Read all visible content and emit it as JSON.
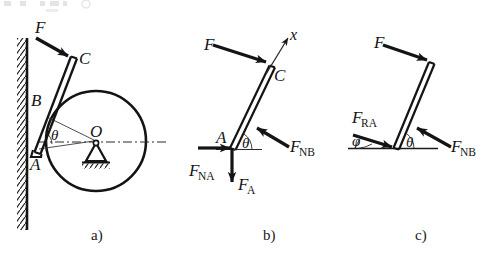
{
  "figure": {
    "title_artifact": "partially cropped text row at top edge",
    "captions": [
      {
        "id": "a",
        "label": "a)",
        "x": 98,
        "y": 238
      },
      {
        "id": "b",
        "label": "b)",
        "x": 270,
        "y": 238
      },
      {
        "id": "c",
        "label": "c)",
        "x": 422,
        "y": 238
      }
    ]
  },
  "panel_a": {
    "name": "rod-leaning-on-cylinder-against-wall",
    "labels": {
      "force_F": "F",
      "point_C": "C",
      "point_B": "B",
      "point_A": "A",
      "point_O": "O",
      "angle_theta": "θ"
    },
    "geometry": {
      "wall_x": 27,
      "wall_top": 38,
      "wall_bottom": 230,
      "circle_center_x": 96,
      "circle_center_y": 141,
      "circle_radius": 50,
      "rod_ax": 35,
      "rod_ay": 151,
      "rod_cx": 73,
      "rod_cy": 57,
      "centerline_y": 142,
      "centerline_x1": 38,
      "centerline_x2": 166
    }
  },
  "panel_b": {
    "name": "free-body-diagram-of-rod",
    "labels": {
      "force_F": "F",
      "axis_x": "x",
      "point_C": "C",
      "point_A": "A",
      "angle_theta": "θ",
      "force_FNB": "F",
      "force_FNB_sub": "NB",
      "force_FNA": "F",
      "force_FNA_sub": "NA",
      "force_FA": "F",
      "force_FA_sub": "A"
    },
    "geometry": {
      "rod_ax": 232,
      "rod_ay": 148,
      "rod_cx": 272,
      "rod_cy": 66
    }
  },
  "panel_c": {
    "name": "three-force-equilibrium-diagram",
    "labels": {
      "force_F": "F",
      "force_FRA": "F",
      "force_FRA_sub": "RA",
      "force_FNB": "F",
      "force_FNB_sub": "NB",
      "angle_phi": "φ",
      "angle_theta": "θ"
    },
    "geometry": {
      "rod_ax": 396,
      "rod_ay": 148,
      "rod_cx": 432,
      "rod_cy": 63,
      "ground_y": 148,
      "ground_x1": 348,
      "ground_x2": 438
    }
  },
  "colors": {
    "ink": "#141414",
    "line": "#1a1a1a",
    "thin": "#3a3a3a",
    "paper": "#ffffff"
  }
}
